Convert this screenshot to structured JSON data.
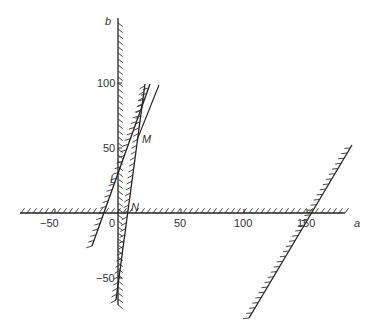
{
  "diagram": {
    "axes": {
      "x_label": "a",
      "y_label": "b",
      "x_ticks": [
        "−50",
        "0",
        "50",
        "100",
        "150"
      ],
      "y_ticks": [
        "100",
        "50",
        "−50"
      ]
    },
    "points": {
      "L": "L",
      "M": "M",
      "N": "N"
    },
    "constraint_lines": [
      {
        "name": "line-through-L",
        "a_intercept": -7,
        "hatch_side": "right"
      },
      {
        "name": "line-through-N",
        "a_intercept": 10,
        "hatch_side": "right"
      },
      {
        "name": "line-through-150",
        "a_intercept": 150,
        "hatch_side": "right"
      }
    ],
    "colors": {
      "ink": "#222222",
      "background": "#ffffff"
    }
  }
}
